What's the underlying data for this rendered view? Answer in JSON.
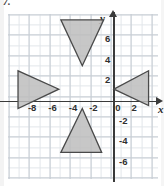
{
  "problem": {
    "number": "7."
  },
  "graph": {
    "x_axis_label": "x",
    "y_axis_label": "y",
    "x_ticks": [
      "-8",
      "-6",
      "-4",
      "-2",
      "0",
      "2"
    ],
    "y_ticks": [
      "6",
      "4",
      "2",
      "-2",
      "-4",
      "-6"
    ],
    "origin_label": "0",
    "colors": {
      "grid_minor": "#e2e6ea",
      "grid_major": "#c6ccd3",
      "axis": "#3a3a3a",
      "shape_fill": "#bdbdbd",
      "shape_stroke": "#4a4a4a",
      "label_text": "#2f2f2f"
    }
  },
  "chart_data": {
    "type": "scatter",
    "title": "",
    "xlabel": "x",
    "ylabel": "y",
    "xlim": [
      -10.3,
      4.4
    ],
    "ylim": [
      -7.6,
      8.5
    ],
    "grid": true,
    "x_tick_values": [
      -8,
      -6,
      -4,
      -2,
      0,
      2
    ],
    "y_tick_values": [
      6,
      4,
      2,
      -2,
      -4,
      -6
    ],
    "legend": "none",
    "shapes": [
      {
        "name": "top-triangle",
        "orientation": "pointing-down",
        "vertices": [
          [
            -5.2,
            8.0
          ],
          [
            -1.0,
            8.0
          ],
          [
            -3.1,
            3.5
          ]
        ]
      },
      {
        "name": "left-triangle",
        "orientation": "pointing-right",
        "vertices": [
          [
            -9.4,
            3.0
          ],
          [
            -9.4,
            -0.7
          ],
          [
            -5.4,
            1.2
          ]
        ]
      },
      {
        "name": "right-triangle",
        "orientation": "pointing-left",
        "vertices": [
          [
            0.0,
            1.2
          ],
          [
            3.4,
            3.0
          ],
          [
            3.4,
            -0.4
          ]
        ]
      },
      {
        "name": "bottom-triangle",
        "orientation": "pointing-up",
        "vertices": [
          [
            -3.1,
            -0.7
          ],
          [
            -5.2,
            -5.0
          ],
          [
            -1.2,
            -5.0
          ]
        ]
      }
    ]
  }
}
